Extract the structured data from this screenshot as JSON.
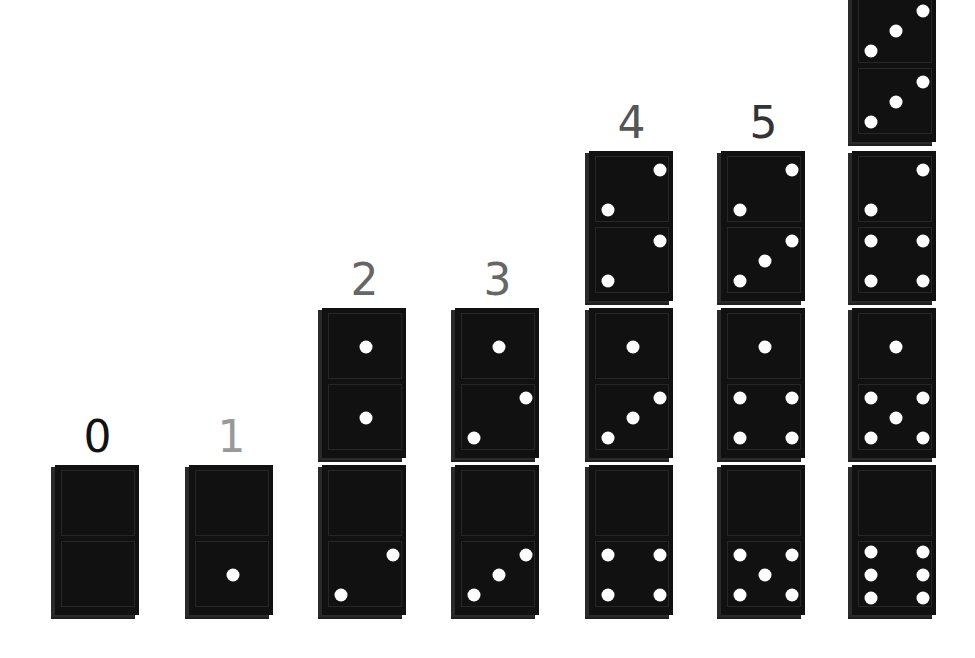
{
  "columns": [
    {
      "label": "0",
      "label_color": "#111111",
      "dominoes": [
        [
          0,
          0
        ]
      ]
    },
    {
      "label": "1",
      "label_color": "#999999",
      "dominoes": [
        [
          0,
          1
        ]
      ]
    },
    {
      "label": "2",
      "label_color": "#666666",
      "dominoes": [
        [
          1,
          1
        ],
        [
          0,
          2
        ]
      ]
    },
    {
      "label": "3",
      "label_color": "#666666",
      "dominoes": [
        [
          1,
          2
        ],
        [
          0,
          3
        ]
      ]
    },
    {
      "label": "4",
      "label_color": "#555555",
      "dominoes": [
        [
          2,
          2
        ],
        [
          1,
          3
        ],
        [
          0,
          4
        ]
      ]
    },
    {
      "label": "5",
      "label_color": "#333333",
      "dominoes": [
        [
          2,
          3
        ],
        [
          1,
          4
        ],
        [
          0,
          5
        ]
      ]
    },
    {
      "label": "6",
      "label_color": "#333333",
      "dominoes": [
        [
          3,
          3
        ],
        [
          2,
          4
        ],
        [
          1,
          5
        ],
        [
          0,
          6
        ]
      ]
    }
  ],
  "colors": {
    "domino": "#111111",
    "pip": "#ffffff",
    "background": "#ffffff"
  }
}
